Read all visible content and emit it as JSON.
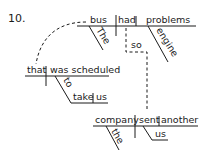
{
  "diagram": {
    "number": "10.",
    "main_clause": {
      "subject": "bus",
      "verb": "had",
      "object": "problems",
      "subject_modifier": "The",
      "object_modifier": "engine"
    },
    "conjunction": "so",
    "relative_clause": {
      "subject": "that",
      "verb": "was scheduled",
      "infinitive_marker": "to",
      "infinitive_verb": "take",
      "infinitive_object": "us"
    },
    "second_clause": {
      "subject": "company",
      "verb": "sent",
      "direct_object": "another",
      "subject_modifier": "the",
      "indirect_object": "us"
    }
  }
}
